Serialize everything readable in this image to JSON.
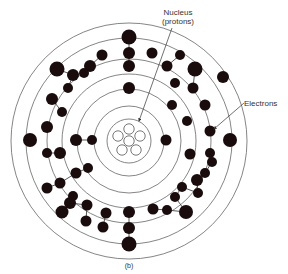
{
  "diagram": {
    "labels": {
      "nucleus_line1": "Nucleus",
      "nucleus_line2": "(protons)",
      "electrons": "Electrons",
      "caption": "(b)"
    },
    "center": [
      129,
      141
    ],
    "ring_color": "#666666",
    "electron_color": "#1a0c0c",
    "nucleus": {
      "radius": 22,
      "protons": [
        [
          0,
          0
        ],
        [
          -11,
          -5
        ],
        [
          0,
          -12
        ],
        [
          11,
          -5
        ],
        [
          -7,
          9
        ],
        [
          7,
          9
        ]
      ],
      "proton_radius": 5.2
    },
    "rings": [
      35,
      52,
      67,
      82,
      103,
      118
    ],
    "electrons": [
      [
        129,
        37,
        7.5
      ],
      [
        129,
        53,
        6
      ],
      [
        129,
        66,
        6
      ],
      [
        129,
        88,
        6
      ],
      [
        102,
        55,
        5.5
      ],
      [
        90,
        66,
        6
      ],
      [
        73,
        75,
        6
      ],
      [
        57,
        69,
        7.5
      ],
      [
        84,
        73,
        5
      ],
      [
        68,
        88,
        5
      ],
      [
        52,
        99,
        6
      ],
      [
        47,
        127,
        6
      ],
      [
        62,
        112,
        5
      ],
      [
        60,
        153,
        6
      ],
      [
        47,
        153,
        5
      ],
      [
        30,
        140,
        7
      ],
      [
        76,
        140,
        6
      ],
      [
        92,
        140,
        5
      ],
      [
        152,
        53,
        5.5
      ],
      [
        167,
        66,
        5.5
      ],
      [
        180,
        55,
        5
      ],
      [
        195,
        69,
        7.5
      ],
      [
        175,
        83,
        5
      ],
      [
        193,
        88,
        5.5
      ],
      [
        205,
        105,
        5.5
      ],
      [
        223,
        77,
        6
      ],
      [
        172,
        105,
        5
      ],
      [
        187,
        121,
        5
      ],
      [
        210,
        131,
        5.5
      ],
      [
        230,
        140,
        7
      ],
      [
        166,
        140,
        5.5
      ],
      [
        210,
        153,
        5
      ],
      [
        190,
        154,
        5.5
      ],
      [
        205,
        173,
        5
      ],
      [
        197,
        180,
        6
      ],
      [
        182,
        187,
        5
      ],
      [
        175,
        197,
        5
      ],
      [
        153,
        209,
        5.5
      ],
      [
        198,
        193,
        5
      ],
      [
        167,
        210,
        5
      ],
      [
        186,
        212,
        7
      ],
      [
        212,
        162,
        5
      ],
      [
        60,
        183,
        5.5
      ],
      [
        47,
        188,
        5.5
      ],
      [
        76,
        173,
        5.5
      ],
      [
        62,
        212,
        6.5
      ],
      [
        70,
        203,
        6
      ],
      [
        73,
        196,
        5
      ],
      [
        88,
        168,
        5
      ],
      [
        87,
        205,
        5.5
      ],
      [
        86,
        221,
        5.5
      ],
      [
        106,
        213,
        5.5
      ],
      [
        103,
        227,
        5.5
      ],
      [
        129,
        212,
        6
      ],
      [
        129,
        228,
        6
      ],
      [
        129,
        244,
        7.5
      ],
      [
        45,
        141,
        0
      ],
      [
        98,
        223,
        0
      ]
    ],
    "arrows": [
      {
        "from": [
          172,
          28
        ],
        "to": [
          139,
          121
        ]
      },
      {
        "from": [
          244,
          103
        ],
        "to": [
          214,
          129
        ]
      }
    ]
  }
}
